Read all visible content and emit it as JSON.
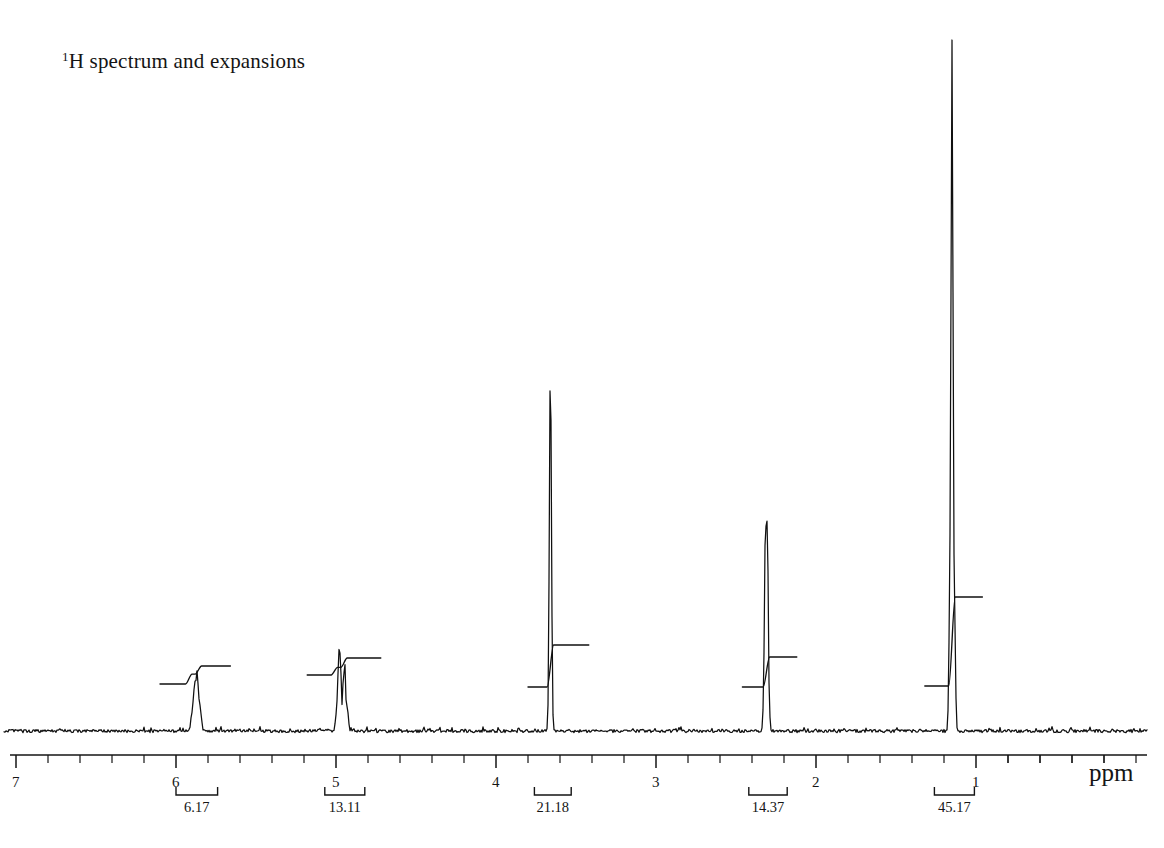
{
  "figure": {
    "title_sup": "1",
    "title_rest": "H spectrum and expansions",
    "title_full": "1H spectrum and expansions"
  },
  "axis": {
    "unit_label": "ppm",
    "major_ticks": [
      "7",
      "6",
      "5",
      "4",
      "3",
      "2",
      "1"
    ],
    "major_tick_values": [
      7,
      6,
      5,
      4,
      3,
      2,
      1
    ],
    "minor_tick_step": 0.2,
    "range_left_ppm": 7.1,
    "range_right_ppm": 0.0,
    "direction": "decreasing-left-to-right"
  },
  "integrals": [
    {
      "label": "6.17",
      "value": 6.17,
      "center_ppm": 5.88,
      "from_ppm": 6.0,
      "to_ppm": 5.74
    },
    {
      "label": "13.11",
      "value": 13.11,
      "center_ppm": 4.97,
      "from_ppm": 5.07,
      "to_ppm": 4.82
    },
    {
      "label": "21.18",
      "value": 21.18,
      "center_ppm": 3.66,
      "from_ppm": 3.76,
      "to_ppm": 3.53
    },
    {
      "label": "14.37",
      "value": 14.37,
      "center_ppm": 2.31,
      "from_ppm": 2.42,
      "to_ppm": 2.18
    },
    {
      "label": "45.17",
      "value": 45.17,
      "center_ppm": 1.14,
      "from_ppm": 1.26,
      "to_ppm": 1.01
    }
  ],
  "chart_data": {
    "type": "line",
    "title": "1H spectrum and expansions",
    "xlabel": "ppm",
    "ylabel": "",
    "xlim": [
      7.1,
      0.0
    ],
    "grid": false,
    "legend": "none",
    "x_axis_reversed": true,
    "peaks": [
      {
        "ppm": 5.88,
        "rel_height": 0.09,
        "multiplicity": "multiplet",
        "integral": 6.17,
        "assignment": "vinyl CH"
      },
      {
        "ppm": 4.97,
        "rel_height": 0.12,
        "multiplicity": "multiplet",
        "integral": 13.11,
        "assignment": "vinyl CH2"
      },
      {
        "ppm": 3.66,
        "rel_height": 0.53,
        "multiplicity": "singlet",
        "integral": 21.18,
        "assignment": "OCH3"
      },
      {
        "ppm": 2.31,
        "rel_height": 0.32,
        "multiplicity": "triplet",
        "integral": 14.37,
        "assignment": "CH2"
      },
      {
        "ppm": 1.15,
        "rel_height": 1.0,
        "multiplicity": "singlet",
        "integral": 45.17,
        "assignment": "CH2 envelope"
      }
    ],
    "baseline_noise": true,
    "integration_labels": [
      "6.17",
      "13.11",
      "21.18",
      "14.37",
      "45.17"
    ]
  }
}
